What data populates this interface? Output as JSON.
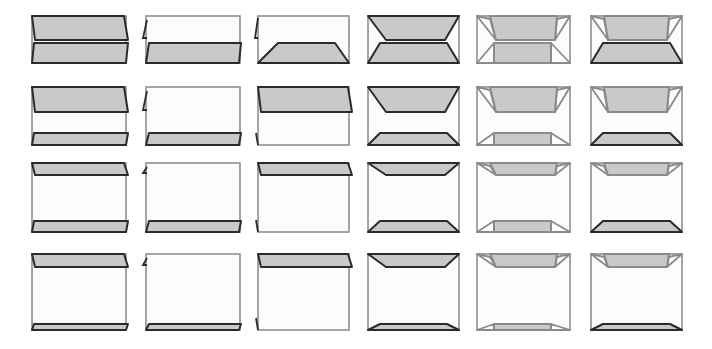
{
  "diagram": {
    "title": "",
    "colors": {
      "flap_fill": "#c9c9c9",
      "dark_stroke": "#2b2b2b",
      "light_stroke": "#8a8a8a",
      "body_fill": "#fcfcfc",
      "body_stroke": "#8f8f8f"
    },
    "columns": [
      {
        "x": 32,
        "w": 94,
        "style": "parallelogram-both"
      },
      {
        "x": 146,
        "w": 94,
        "style": "parallelogram-bottom"
      },
      {
        "x": 258,
        "w": 91,
        "style": "trapezoid-bottom"
      },
      {
        "x": 368,
        "w": 91,
        "style": "trapezoid-both"
      },
      {
        "x": 477,
        "w": 93,
        "style": "inset-both"
      },
      {
        "x": 591,
        "w": 91,
        "style": "inset-top-trapezoid-bottom"
      }
    ],
    "rows": [
      {
        "y": 16,
        "h": 47,
        "top_flap_depth": 24,
        "bottom_flap_depth": 20
      },
      {
        "y": 87,
        "h": 58,
        "top_flap_depth": 25,
        "bottom_flap_depth": 12
      },
      {
        "y": 163,
        "h": 69,
        "top_flap_depth": 12,
        "bottom_flap_depth": 11
      },
      {
        "y": 254,
        "h": 76,
        "top_flap_depth": 13,
        "bottom_flap_depth": 6
      }
    ],
    "cells": [
      {
        "row": 0,
        "col": 0,
        "name": "cell-r1-c1"
      },
      {
        "row": 0,
        "col": 1,
        "name": "cell-r1-c2"
      },
      {
        "row": 0,
        "col": 2,
        "name": "cell-r1-c3"
      },
      {
        "row": 0,
        "col": 3,
        "name": "cell-r1-c4"
      },
      {
        "row": 0,
        "col": 4,
        "name": "cell-r1-c5"
      },
      {
        "row": 0,
        "col": 5,
        "name": "cell-r1-c6"
      },
      {
        "row": 1,
        "col": 0,
        "name": "cell-r2-c1"
      },
      {
        "row": 1,
        "col": 1,
        "name": "cell-r2-c2"
      },
      {
        "row": 1,
        "col": 2,
        "name": "cell-r2-c3"
      },
      {
        "row": 1,
        "col": 3,
        "name": "cell-r2-c4"
      },
      {
        "row": 1,
        "col": 4,
        "name": "cell-r2-c5"
      },
      {
        "row": 1,
        "col": 5,
        "name": "cell-r2-c6"
      },
      {
        "row": 2,
        "col": 0,
        "name": "cell-r3-c1"
      },
      {
        "row": 2,
        "col": 1,
        "name": "cell-r3-c2"
      },
      {
        "row": 2,
        "col": 2,
        "name": "cell-r3-c3"
      },
      {
        "row": 2,
        "col": 3,
        "name": "cell-r3-c4"
      },
      {
        "row": 2,
        "col": 4,
        "name": "cell-r3-c5"
      },
      {
        "row": 2,
        "col": 5,
        "name": "cell-r3-c6"
      },
      {
        "row": 3,
        "col": 0,
        "name": "cell-r4-c1"
      },
      {
        "row": 3,
        "col": 1,
        "name": "cell-r4-c2"
      },
      {
        "row": 3,
        "col": 2,
        "name": "cell-r4-c3"
      },
      {
        "row": 3,
        "col": 3,
        "name": "cell-r4-c4"
      },
      {
        "row": 3,
        "col": 4,
        "name": "cell-r4-c5"
      },
      {
        "row": 3,
        "col": 5,
        "name": "cell-r4-c6"
      }
    ]
  }
}
